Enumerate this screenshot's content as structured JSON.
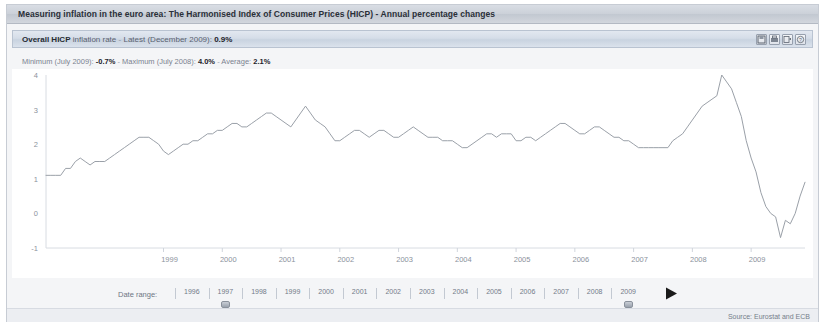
{
  "window": {
    "title": "Measuring inflation in the euro area: The Harmonised Index of Consumer Prices (HICP) - Annual percentage changes"
  },
  "subheader": {
    "series_name": "Overall HICP",
    "series_qualifier": "inflation rate",
    "separator": "-",
    "latest_label": "Latest (December 2009):",
    "latest_value": "0.9%",
    "icons": [
      {
        "name": "save-icon",
        "title": "Save"
      },
      {
        "name": "print-icon",
        "title": "Print"
      },
      {
        "name": "export-icon",
        "title": "Export"
      },
      {
        "name": "help-icon",
        "title": "Help"
      }
    ]
  },
  "stats": {
    "minimum_label": "Minimum (July 2009):",
    "minimum_value": "-0.7%",
    "dash1": "-",
    "maximum_label": "Maximum (July 2008):",
    "maximum_value": "4.0%",
    "dash2": "-",
    "average_label": "Average:",
    "average_value": "2.1%"
  },
  "controls": {
    "date_range_label": "Date range:",
    "slider_years": [
      "1996",
      "1997",
      "1998",
      "1999",
      "2000",
      "2001",
      "2002",
      "2003",
      "2004",
      "2005",
      "2006",
      "2007",
      "2008",
      "2009"
    ],
    "handle_left_year": "1997",
    "handle_right_year": "2009",
    "play_button": "play-button"
  },
  "footer": {
    "source": "Source: Eurostat and ECB"
  },
  "chart_data": {
    "type": "line",
    "xlabel": "",
    "ylabel": "",
    "grid": false,
    "legend": "none",
    "line_color": "#9aa0a8",
    "xlim": [
      "1997-01",
      "2009-12"
    ],
    "ylim": [
      -1,
      4
    ],
    "ytick_labels": [
      "4",
      "3",
      "2",
      "1",
      "0",
      "-1"
    ],
    "ytick_values": [
      4,
      3,
      2,
      1,
      0,
      -1
    ],
    "xtick_labels": [
      "1999",
      "2000",
      "2001",
      "2002",
      "2003",
      "2004",
      "2005",
      "2006",
      "2007",
      "2008",
      "2009"
    ],
    "xtick_values": [
      "1999-01",
      "2000-01",
      "2001-01",
      "2002-01",
      "2003-01",
      "2004-01",
      "2005-01",
      "2006-01",
      "2007-01",
      "2008-01",
      "2009-01"
    ],
    "annotations": {
      "minimum": {
        "date": "2009-07",
        "value": -0.7
      },
      "maximum": {
        "date": "2008-07",
        "value": 4.0
      },
      "latest": {
        "date": "2009-12",
        "value": 0.9
      },
      "average": 2.1
    },
    "series": [
      {
        "name": "Overall HICP",
        "x": [
          "1997-01",
          "1997-02",
          "1997-03",
          "1997-04",
          "1997-05",
          "1997-06",
          "1997-07",
          "1997-08",
          "1997-09",
          "1997-10",
          "1997-11",
          "1997-12",
          "1998-01",
          "1998-02",
          "1998-03",
          "1998-04",
          "1998-05",
          "1998-06",
          "1998-07",
          "1998-08",
          "1998-09",
          "1998-10",
          "1998-11",
          "1998-12",
          "1999-01",
          "1999-02",
          "1999-03",
          "1999-04",
          "1999-05",
          "1999-06",
          "1999-07",
          "1999-08",
          "1999-09",
          "1999-10",
          "1999-11",
          "1999-12",
          "2000-01",
          "2000-02",
          "2000-03",
          "2000-04",
          "2000-05",
          "2000-06",
          "2000-07",
          "2000-08",
          "2000-09",
          "2000-10",
          "2000-11",
          "2000-12",
          "2001-01",
          "2001-02",
          "2001-03",
          "2001-04",
          "2001-05",
          "2001-06",
          "2001-07",
          "2001-08",
          "2001-09",
          "2001-10",
          "2001-11",
          "2001-12",
          "2002-01",
          "2002-02",
          "2002-03",
          "2002-04",
          "2002-05",
          "2002-06",
          "2002-07",
          "2002-08",
          "2002-09",
          "2002-10",
          "2002-11",
          "2002-12",
          "2003-01",
          "2003-02",
          "2003-03",
          "2003-04",
          "2003-05",
          "2003-06",
          "2003-07",
          "2003-08",
          "2003-09",
          "2003-10",
          "2003-11",
          "2003-12",
          "2004-01",
          "2004-02",
          "2004-03",
          "2004-04",
          "2004-05",
          "2004-06",
          "2004-07",
          "2004-08",
          "2004-09",
          "2004-10",
          "2004-11",
          "2004-12",
          "2005-01",
          "2005-02",
          "2005-03",
          "2005-04",
          "2005-05",
          "2005-06",
          "2005-07",
          "2005-08",
          "2005-09",
          "2005-10",
          "2005-11",
          "2005-12",
          "2006-01",
          "2006-02",
          "2006-03",
          "2006-04",
          "2006-05",
          "2006-06",
          "2006-07",
          "2006-08",
          "2006-09",
          "2006-10",
          "2006-11",
          "2006-12",
          "2007-01",
          "2007-02",
          "2007-03",
          "2007-04",
          "2007-05",
          "2007-06",
          "2007-07",
          "2007-08",
          "2007-09",
          "2007-10",
          "2007-11",
          "2007-12",
          "2008-01",
          "2008-02",
          "2008-03",
          "2008-04",
          "2008-05",
          "2008-06",
          "2008-07",
          "2008-08",
          "2008-09",
          "2008-10",
          "2008-11",
          "2008-12",
          "2009-01",
          "2009-02",
          "2009-03",
          "2009-04",
          "2009-05",
          "2009-06",
          "2009-07",
          "2009-08",
          "2009-09",
          "2009-10",
          "2009-11",
          "2009-12"
        ],
        "values": [
          1.1,
          1.1,
          1.1,
          1.1,
          1.3,
          1.3,
          1.5,
          1.6,
          1.5,
          1.4,
          1.5,
          1.5,
          1.5,
          1.6,
          1.7,
          1.8,
          1.9,
          2.0,
          2.1,
          2.2,
          2.2,
          2.2,
          2.1,
          2.0,
          1.8,
          1.7,
          1.8,
          1.9,
          2.0,
          2.0,
          2.1,
          2.1,
          2.2,
          2.3,
          2.3,
          2.4,
          2.4,
          2.5,
          2.6,
          2.6,
          2.5,
          2.5,
          2.6,
          2.7,
          2.8,
          2.9,
          2.9,
          2.8,
          2.7,
          2.6,
          2.5,
          2.7,
          2.9,
          3.1,
          2.9,
          2.7,
          2.6,
          2.5,
          2.3,
          2.1,
          2.1,
          2.2,
          2.3,
          2.4,
          2.4,
          2.3,
          2.2,
          2.3,
          2.4,
          2.4,
          2.3,
          2.2,
          2.2,
          2.3,
          2.4,
          2.5,
          2.4,
          2.3,
          2.2,
          2.2,
          2.2,
          2.1,
          2.1,
          2.1,
          2.0,
          1.9,
          1.9,
          2.0,
          2.1,
          2.2,
          2.3,
          2.3,
          2.2,
          2.3,
          2.3,
          2.3,
          2.1,
          2.1,
          2.2,
          2.2,
          2.1,
          2.2,
          2.3,
          2.4,
          2.5,
          2.6,
          2.6,
          2.5,
          2.4,
          2.3,
          2.3,
          2.4,
          2.5,
          2.5,
          2.4,
          2.3,
          2.2,
          2.2,
          2.1,
          2.1,
          2.0,
          1.9,
          1.9,
          1.9,
          1.9,
          1.9,
          1.9,
          1.9,
          2.1,
          2.2,
          2.3,
          2.5,
          2.7,
          2.9,
          3.1,
          3.2,
          3.3,
          3.4,
          4.0,
          3.8,
          3.6,
          3.2,
          2.8,
          2.1,
          1.6,
          1.2,
          0.6,
          0.2,
          0.0,
          -0.1,
          -0.7,
          -0.2,
          -0.3,
          0.0,
          0.5,
          0.9
        ]
      }
    ]
  }
}
